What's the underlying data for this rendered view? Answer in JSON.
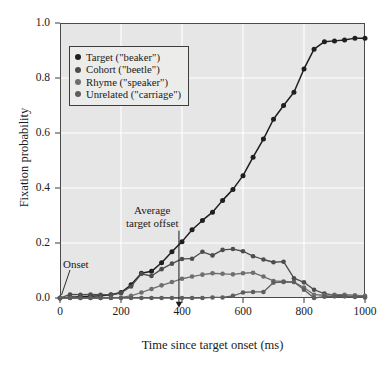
{
  "chart_data": {
    "type": "line",
    "title": "",
    "xlabel": "Time since target onset (ms)",
    "ylabel": "Fixation probability",
    "xlim": [
      0,
      1000
    ],
    "ylim": [
      0.0,
      1.0
    ],
    "xticks": [
      0,
      200,
      400,
      600,
      800,
      1000
    ],
    "yticks": [
      "0.0",
      "0.2",
      "0.4",
      "0.6",
      "0.8",
      "1.0"
    ],
    "grid": true,
    "grid_color": "#ffffff",
    "plot_background": "#e6e6e6",
    "legend_position": "upper-left",
    "x": [
      0,
      33,
      67,
      100,
      133,
      167,
      200,
      233,
      267,
      300,
      333,
      367,
      400,
      433,
      467,
      500,
      533,
      567,
      600,
      633,
      667,
      700,
      733,
      767,
      800,
      833,
      867,
      900,
      933,
      967,
      1000
    ],
    "series": [
      {
        "name": "Target (\"beaker\")",
        "legend_label": "Target (\"beaker\")",
        "color": "#1f1f1f",
        "values": [
          0.0,
          0.003,
          0.005,
          0.006,
          0.008,
          0.012,
          0.02,
          0.048,
          0.09,
          0.097,
          0.128,
          0.168,
          0.205,
          0.248,
          0.282,
          0.312,
          0.355,
          0.395,
          0.445,
          0.512,
          0.578,
          0.65,
          0.7,
          0.748,
          0.833,
          0.905,
          0.932,
          0.935,
          0.938,
          0.945,
          0.945
        ]
      },
      {
        "name": "Cohort (\"beetle\")",
        "legend_label": "Cohort (\"beetle\")",
        "color": "#4d4d4d",
        "values": [
          0.0,
          0.013,
          0.012,
          0.013,
          0.012,
          0.011,
          0.018,
          0.042,
          0.088,
          0.08,
          0.105,
          0.125,
          0.142,
          0.143,
          0.168,
          0.155,
          0.175,
          0.178,
          0.17,
          0.152,
          0.14,
          0.13,
          0.132,
          0.072,
          0.057,
          0.03,
          0.016,
          0.01,
          0.008,
          0.006,
          0.005
        ]
      },
      {
        "name": "Rhyme (\"speaker\")",
        "legend_label": "Rhyme (\"speaker\")",
        "color": "#6e6e6e",
        "values": [
          0.0,
          0.0,
          0.0,
          0.0,
          0.0,
          0.001,
          0.002,
          0.008,
          0.02,
          0.033,
          0.046,
          0.058,
          0.07,
          0.078,
          0.085,
          0.09,
          0.088,
          0.086,
          0.09,
          0.092,
          0.078,
          0.062,
          0.06,
          0.058,
          0.038,
          0.012,
          0.01,
          0.012,
          0.012,
          0.01,
          0.008
        ]
      },
      {
        "name": "Unrelated (\"carriage\")",
        "legend_label": "Unrelated (\"carriage\")",
        "color": "#5e5e5e",
        "values": [
          0.0,
          0.0,
          0.0,
          0.0,
          0.0,
          0.0,
          0.0,
          0.0,
          0.0,
          0.0,
          0.0,
          0.0,
          0.0,
          0.0,
          0.0,
          0.002,
          0.002,
          0.008,
          0.02,
          0.022,
          0.022,
          0.056,
          0.058,
          0.058,
          0.03,
          0.0,
          0.005,
          0.006,
          0.006,
          0.004,
          0.002
        ]
      }
    ],
    "annotations": [
      {
        "id": "onset",
        "text": "Onset",
        "target_x": 0,
        "target_y": 0.0
      },
      {
        "id": "average-target-offset",
        "text_line1": "Average",
        "text_line2": "target offset",
        "arrow_x": 390,
        "arrow_from_y": 0.245,
        "arrow_to_y": -0.035
      }
    ]
  },
  "axes": {
    "y_title": "Fixation probability",
    "x_title": "Time since target onset (ms)",
    "y_ticks": [
      "1.0",
      "0.8",
      "0.6",
      "0.4",
      "0.2",
      "0.0"
    ],
    "x_ticks": [
      "0",
      "200",
      "400",
      "600",
      "800",
      "1000"
    ]
  },
  "legend": {
    "items": [
      {
        "label": "Target (\"beaker\")",
        "color": "#1f1f1f"
      },
      {
        "label": "Cohort (\"beetle\")",
        "color": "#4d4d4d"
      },
      {
        "label": "Rhyme (\"speaker\")",
        "color": "#6e6e6e"
      },
      {
        "label": "Unrelated (\"carriage\")",
        "color": "#5e5e5e"
      }
    ]
  },
  "annotations": {
    "onset": "Onset",
    "offset_line1": "Average",
    "offset_line2": "target offset"
  }
}
